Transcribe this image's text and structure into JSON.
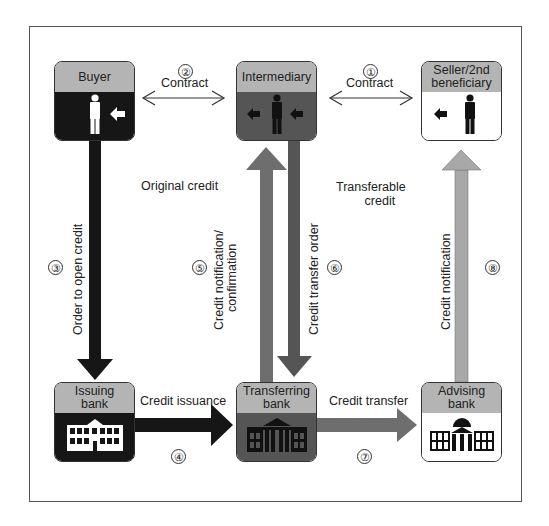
{
  "colors": {
    "black_arrow": "#161616",
    "dark_arrow": "#555555",
    "mid_arrow": "#6e6e6e",
    "light_arrow": "#a8a8a8",
    "header_gray": "#b4b4b4"
  },
  "nodes": {
    "buyer": {
      "label": "Buyer",
      "icon": "person-icon"
    },
    "intermediary": {
      "label": "Intermediary",
      "icon": "person-icon"
    },
    "seller": {
      "label": "Seller/2nd beneficiary",
      "line1": "Seller/2nd",
      "line2": "beneficiary",
      "icon": "person-icon"
    },
    "issuing_bank": {
      "label": "Issuing bank",
      "line1": "Issuing",
      "line2": "bank",
      "icon": "bank-building-icon"
    },
    "transferring_bank": {
      "label": "Transferring bank",
      "line1": "Transferring",
      "line2": "bank",
      "icon": "bank-building-icon"
    },
    "advising_bank": {
      "label": "Advising bank",
      "line1": "Advising",
      "line2": "bank",
      "icon": "bank-building-icon"
    }
  },
  "flows": [
    {
      "step": "①",
      "label": "Contract",
      "from": "Intermediary",
      "to": "Seller/2nd beneficiary"
    },
    {
      "step": "②",
      "label": "Contract",
      "from": "Buyer",
      "to": "Intermediary"
    },
    {
      "step": "③",
      "label": "Order to open credit",
      "from": "Buyer",
      "to": "Issuing bank"
    },
    {
      "step": "④",
      "label": "Credit issuance",
      "from": "Issuing bank",
      "to": "Transferring bank"
    },
    {
      "step": "⑤",
      "label": "Credit notification/ confirmation",
      "line1": "Credit notification/",
      "line2": "confirmation",
      "from": "Transferring bank",
      "to": "Intermediary"
    },
    {
      "step": "⑥",
      "label": "Credit transfer order",
      "from": "Intermediary",
      "to": "Transferring bank"
    },
    {
      "step": "⑦",
      "label": "Credit transfer",
      "from": "Transferring bank",
      "to": "Advising bank"
    },
    {
      "step": "⑧",
      "label": "Credit notification",
      "from": "Advising bank",
      "to": "Seller/2nd beneficiary"
    }
  ],
  "annotations": {
    "original_credit": "Original credit",
    "transferable_credit_line1": "Transferable",
    "transferable_credit_line2": "credit"
  }
}
